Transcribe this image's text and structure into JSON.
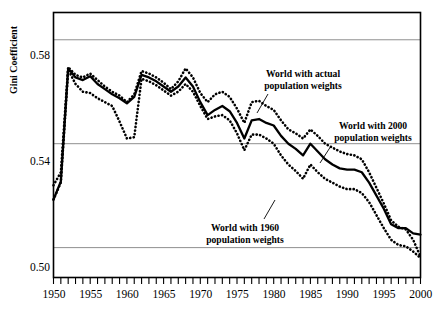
{
  "figure": {
    "ylabel": "Gini Coefficient",
    "y_ticks": [
      "0.58",
      "0.54",
      "0.50"
    ],
    "x_ticks": [
      "1950",
      "1955",
      "1960",
      "1965",
      "1970",
      "1975",
      "1980",
      "1985",
      "1990",
      "1995",
      "2000"
    ],
    "annotations": [
      {
        "id": "actual",
        "line1": "World with actual",
        "line2": "population weights"
      },
      {
        "id": "w2000",
        "line1": "World with 2000",
        "line2": "population weights"
      },
      {
        "id": "w1960",
        "line1": "World with 1960",
        "line2": "population weights"
      }
    ]
  },
  "chart_data": {
    "type": "line",
    "title": "",
    "xlabel": "",
    "ylabel": "Gini Coefficient",
    "xlim": [
      1950,
      2000
    ],
    "ylim": [
      0.4885,
      0.5905
    ],
    "y_tick_values": [
      0.58,
      0.54,
      0.5
    ],
    "x_tick_values": [
      1950,
      1955,
      1960,
      1965,
      1970,
      1975,
      1980,
      1985,
      1990,
      1995,
      2000
    ],
    "x_minor_tick_step": 1,
    "grid": "horizontal-only",
    "legend": "inline-annotations",
    "x": [
      1950,
      1951,
      1952,
      1953,
      1954,
      1955,
      1956,
      1957,
      1958,
      1959,
      1960,
      1961,
      1962,
      1963,
      1964,
      1965,
      1966,
      1967,
      1968,
      1969,
      1970,
      1971,
      1972,
      1973,
      1974,
      1975,
      1976,
      1977,
      1978,
      1979,
      1980,
      1981,
      1982,
      1983,
      1984,
      1985,
      1986,
      1987,
      1988,
      1989,
      1990,
      1991,
      1992,
      1993,
      1994,
      1995,
      1996,
      1997,
      1998,
      1999,
      2000
    ],
    "series": [
      {
        "name": "World with actual population weights",
        "style": "solid-thick-black",
        "color": "#000000",
        "values": [
          0.5185,
          0.5255,
          0.569,
          0.5655,
          0.5645,
          0.566,
          0.563,
          0.561,
          0.559,
          0.5575,
          0.5555,
          0.558,
          0.5665,
          0.5655,
          0.564,
          0.562,
          0.56,
          0.562,
          0.5655,
          0.562,
          0.556,
          0.551,
          0.553,
          0.5545,
          0.5525,
          0.548,
          0.542,
          0.549,
          0.5495,
          0.548,
          0.547,
          0.543,
          0.54,
          0.538,
          0.5355,
          0.54,
          0.537,
          0.534,
          0.532,
          0.5305,
          0.53,
          0.53,
          0.529,
          0.525,
          0.52,
          0.515,
          0.509,
          0.5075,
          0.5075,
          0.5055,
          0.505
        ]
      },
      {
        "name": "World with 2000 population weights",
        "style": "dotted-black",
        "color": "#000000",
        "values": [
          0.524,
          0.529,
          0.5695,
          0.5665,
          0.5655,
          0.567,
          0.5645,
          0.562,
          0.56,
          0.5585,
          0.556,
          0.559,
          0.568,
          0.567,
          0.5655,
          0.5635,
          0.561,
          0.564,
          0.569,
          0.5655,
          0.5595,
          0.556,
          0.559,
          0.56,
          0.558,
          0.5535,
          0.548,
          0.556,
          0.5565,
          0.5545,
          0.553,
          0.549,
          0.5455,
          0.544,
          0.542,
          0.5455,
          0.543,
          0.54,
          0.5385,
          0.537,
          0.536,
          0.5355,
          0.534,
          0.529,
          0.523,
          0.517,
          0.5105,
          0.508,
          0.507,
          0.503,
          0.4965
        ]
      },
      {
        "name": "World with 1960 population weights",
        "style": "dotted-black",
        "color": "#000000",
        "values": [
          0.5185,
          0.525,
          0.5685,
          0.563,
          0.56,
          0.5595,
          0.5575,
          0.556,
          0.5545,
          0.5485,
          0.542,
          0.5425,
          0.565,
          0.564,
          0.5625,
          0.5605,
          0.5585,
          0.56,
          0.563,
          0.56,
          0.5545,
          0.5495,
          0.5505,
          0.551,
          0.549,
          0.544,
          0.5375,
          0.5435,
          0.5435,
          0.542,
          0.54,
          0.5355,
          0.532,
          0.5295,
          0.5265,
          0.532,
          0.529,
          0.5265,
          0.525,
          0.5235,
          0.5225,
          0.5225,
          0.521,
          0.5175,
          0.5125,
          0.5075,
          0.503,
          0.501,
          0.5005,
          0.4985,
          0.496
        ]
      }
    ]
  }
}
